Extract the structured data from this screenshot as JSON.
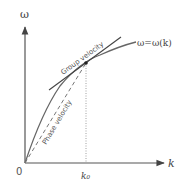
{
  "diagram": {
    "axes": {
      "y_label": "ω",
      "x_label": "k",
      "origin_label": "0"
    },
    "curve_label": "ω=ω(k)",
    "point_label": "k₀",
    "tangent_label": "Group velocity",
    "secant_label": "Phase velocity",
    "colors": {
      "axis": "#555555",
      "curve": "#666666",
      "tangent": "#444444",
      "dashed": "#777777",
      "point": "#222222"
    }
  }
}
